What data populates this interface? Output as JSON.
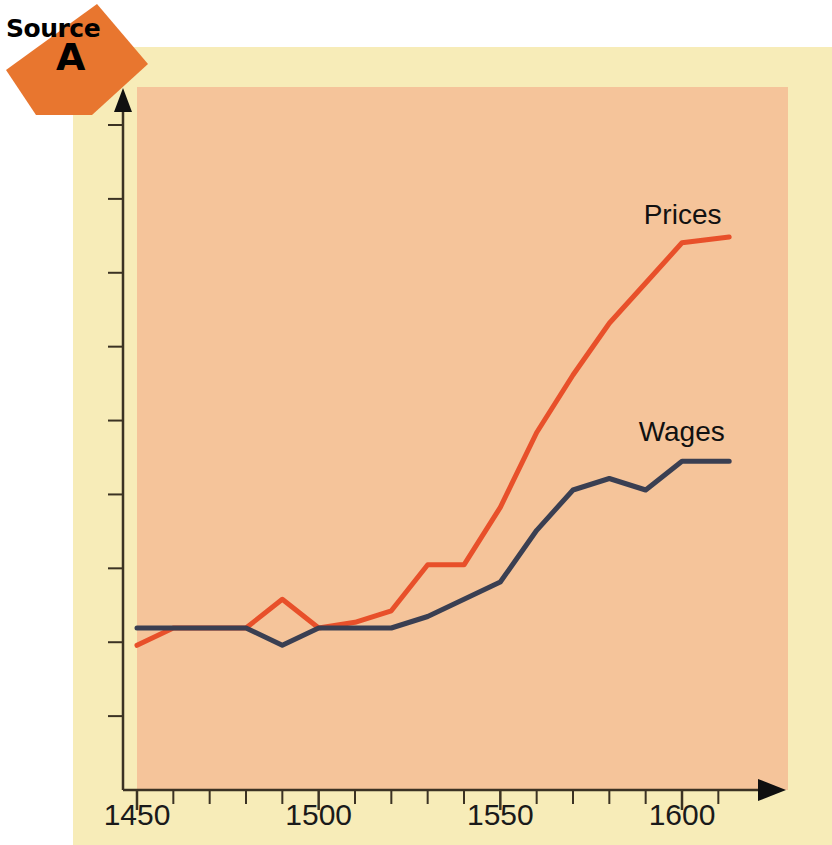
{
  "badge": {
    "word": "Source",
    "letter": "A",
    "shape_color": "#E8762F"
  },
  "colors": {
    "page_background": "#FFFFFF",
    "cream_panel": "#F7ECB8",
    "plot_field": "#F5C49A",
    "axis": "#3B3223",
    "prices_line": "#E8502A",
    "wages_line": "#3A3F52",
    "text": "#111111"
  },
  "axis": {
    "x_tick_labels": [
      "1450",
      "1500",
      "1550",
      "1600"
    ],
    "x_tick_values": [
      1450,
      1500,
      1550,
      1600
    ],
    "x_minor_tick_step": 10,
    "y_tick_count": 9,
    "y_axis_labelled": false
  },
  "labels": {
    "prices": "Prices",
    "wages": "Wages"
  },
  "chart_data": {
    "type": "line",
    "title": "",
    "subtitle": "",
    "xlabel": "",
    "ylabel": "",
    "xlim": [
      1450,
      1613
    ],
    "ylim": [
      0,
      100
    ],
    "grid": false,
    "legend": "inline-end-of-line",
    "axis_arrows": true,
    "x": [
      1450,
      1460,
      1470,
      1480,
      1490,
      1500,
      1510,
      1520,
      1530,
      1540,
      1550,
      1560,
      1570,
      1580,
      1590,
      1600,
      1613
    ],
    "series": [
      {
        "name": "Prices",
        "color": "#E8502A",
        "label_x": 1600,
        "values": [
          17,
          20,
          20,
          20,
          25,
          20,
          21,
          23,
          31,
          31,
          41,
          54,
          64,
          73,
          80,
          87,
          88
        ]
      },
      {
        "name": "Wages",
        "color": "#3A3F52",
        "label_x": 1592,
        "values": [
          20,
          20,
          20,
          20,
          17,
          20,
          20,
          20,
          22,
          25,
          28,
          37,
          44,
          46,
          44,
          49,
          49
        ]
      }
    ]
  }
}
